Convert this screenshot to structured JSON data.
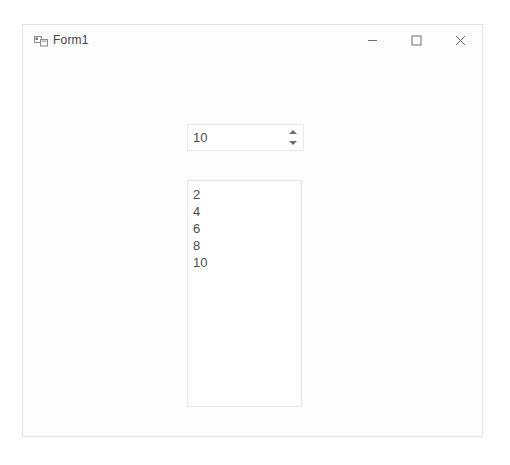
{
  "window": {
    "title": "Form1",
    "icon": "winforms-app-icon",
    "controls": {
      "minimize_label": "Minimize",
      "maximize_label": "Maximize",
      "close_label": "Close",
      "minimize_icon": "minimize-icon",
      "maximize_icon": "maximize-icon",
      "close_icon": "close-icon"
    }
  },
  "form": {
    "numeric_updown": {
      "value": "10",
      "placeholder": "",
      "increment_icon": "spinner-up-arrow-icon",
      "decrement_icon": "spinner-down-arrow-icon"
    },
    "listbox": {
      "items": [
        "2",
        "4",
        "6",
        "8",
        "10"
      ]
    }
  },
  "colors": {
    "window_background": "#fdfdfd",
    "page_background": "#ffffff",
    "border": "#e6e6e6",
    "text": "#4a4a4a",
    "title_text": "#414141",
    "glyph": "#6e6e6e"
  }
}
